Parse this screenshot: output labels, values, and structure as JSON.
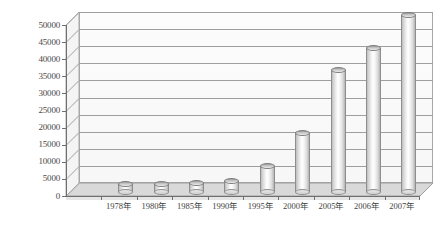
{
  "chart_data": {
    "type": "bar",
    "title": "",
    "xlabel": "",
    "ylabel": "",
    "categories": [
      "1978年",
      "1980年",
      "1985年",
      "1990年",
      "1995年",
      "2000年",
      "2005年",
      "2006年",
      "2007年"
    ],
    "values": [
      1500,
      1600,
      2000,
      2500,
      7000,
      16500,
      35000,
      41500,
      51000
    ],
    "ylim": [
      0,
      50000
    ],
    "ytick_labels": [
      "50000",
      "45000",
      "40000",
      "35000",
      "30000",
      "25000",
      "20000",
      "15000",
      "10000",
      "5000",
      "0"
    ],
    "ytick_values": [
      50000,
      45000,
      40000,
      35000,
      30000,
      25000,
      20000,
      15000,
      10000,
      5000,
      0
    ],
    "grid": true,
    "legend": "none",
    "style": "3d-cylinder",
    "colors": {
      "bar_light": "#ffffff",
      "bar_mid": "#d8d8d8",
      "bar_dark": "#b4b4b4",
      "bar_cap": "#c9c9c9",
      "axis": "#6f6f6f",
      "gridline": "#9e9e9e",
      "floor": "#d7d7d7",
      "wall": "#f7f7f7",
      "text": "#3f3f3f"
    }
  }
}
